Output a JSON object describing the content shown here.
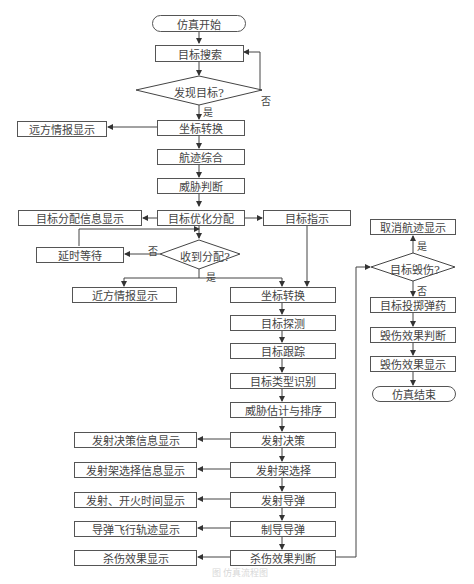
{
  "flowchart": {
    "start": "仿真开始",
    "search": "目标搜索",
    "found_decision": "发现目标?",
    "coord1": "坐标转换",
    "far_display": "远方情报显示",
    "track_fusion": "航迹综合",
    "threat_judge": "威胁判断",
    "target_opt_assign": "目标优化分配",
    "assign_info_display": "目标分配信息显示",
    "target_indicate": "目标指示",
    "received_decision": "收到分配?",
    "delay_wait": "延时等待",
    "near_display": "近方情报显示",
    "coord2": "坐标转换",
    "target_detect": "目标探测",
    "target_track": "目标跟踪",
    "type_identify": "目标类型识别",
    "threat_eval_sort": "威胁估计与排序",
    "launch_decision": "发射决策",
    "launch_decision_display": "发射决策信息显示",
    "launcher_select": "发射架选择",
    "launcher_select_display": "发射架选择信息显示",
    "launch_missile": "发射导弹",
    "launch_fire_time_display": "发射、开火时间显示",
    "guide_missile": "制导导弹",
    "flight_track_display": "导弹飞行轨迹显示",
    "kill_effect_judge": "杀伤效果判断",
    "kill_effect_display": "杀伤效果显示",
    "destroyed_decision": "目标毁伤?",
    "cancel_track_display": "取消航迹显示",
    "drop_munition": "目标投掷弹药",
    "damage_effect_judge": "毁伤效果判断",
    "damage_effect_display": "毁伤效果显示",
    "end": "仿真结束"
  },
  "labels": {
    "yes": "是",
    "no": "否"
  },
  "caption": "图 仿真流程图"
}
